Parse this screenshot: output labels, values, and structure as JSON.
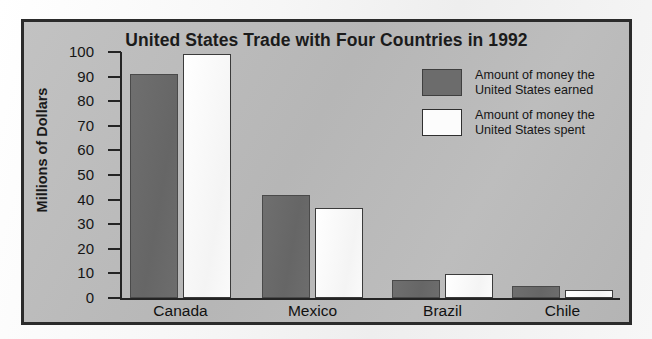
{
  "chart_data": {
    "type": "bar",
    "title": "United States Trade with Four Countries in 1992",
    "xlabel": "",
    "ylabel": "Millions of Dollars",
    "categories": [
      "Canada",
      "Mexico",
      "Brazil",
      "Chile"
    ],
    "series": [
      {
        "name": "Amount of money the United States earned",
        "name_line1": "Amount of money the",
        "name_line2": "United States earned",
        "color": "#6c6c6c",
        "values": [
          91,
          42,
          7.5,
          5
        ]
      },
      {
        "name": "Amount of money the United States spent",
        "name_line1": "Amount of money the",
        "name_line2": "United States spent",
        "color": "#fcfcfc",
        "values": [
          99,
          36.5,
          9.8,
          3.2
        ]
      }
    ],
    "ylim": [
      0,
      100
    ],
    "yticks": [
      0,
      10,
      20,
      30,
      40,
      50,
      60,
      70,
      80,
      90,
      100
    ],
    "ytick_labels": [
      "0",
      "10",
      "20",
      "30",
      "40",
      "50",
      "60",
      "70",
      "80",
      "90",
      "100"
    ],
    "grid": false,
    "legend_position": "upper right"
  },
  "colors": {
    "chart_background": "#b9b9b9",
    "page_background": "#f2f2f2",
    "frame_border": "#2b2b2b",
    "axis": "#242424",
    "earned_bar": "#6c6c6c",
    "spent_bar": "#fcfcfc",
    "text": "#151515"
  }
}
